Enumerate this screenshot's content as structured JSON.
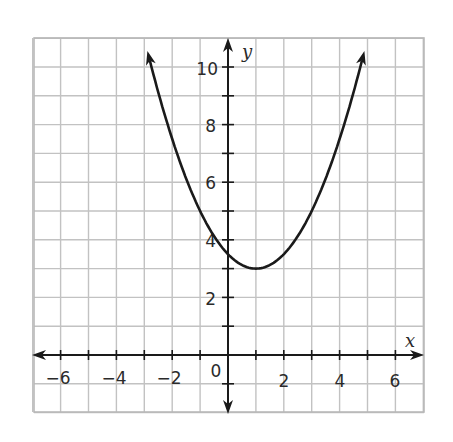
{
  "chart_data": {
    "type": "line",
    "title": "",
    "xlabel": "x",
    "ylabel": "y",
    "xlim": [
      -7,
      7
    ],
    "ylim": [
      -2,
      11
    ],
    "grid": true,
    "x_ticks": [
      -6,
      -5,
      -4,
      -3,
      -2,
      -1,
      1,
      2,
      3,
      4,
      5,
      6
    ],
    "x_tick_labels": [
      "-6",
      "-4",
      "-2",
      "0",
      "2",
      "4",
      "6"
    ],
    "y_ticks": [
      -1,
      1,
      2,
      3,
      4,
      5,
      6,
      7,
      8,
      9,
      10
    ],
    "y_tick_labels": [
      "2",
      "4",
      "6",
      "8",
      "10"
    ],
    "origin_label": "0",
    "series": [
      {
        "name": "parabola",
        "equation": "y = 0.5(x - 1)^2 + 3",
        "vertex": [
          1,
          3
        ],
        "y_intercept": 3.5,
        "x": [
          -3,
          -2,
          -1,
          0,
          1,
          2,
          3,
          4,
          5
        ],
        "values": [
          11,
          7.5,
          5,
          3.5,
          3,
          3.5,
          5,
          7.5,
          11
        ],
        "color": "#1a1a1a",
        "arrows_at_ends": true
      }
    ]
  },
  "labels": {
    "x_axis": "x",
    "y_axis": "y",
    "origin": "0",
    "x_neg6": "−6",
    "x_neg4": "−4",
    "x_neg2": "−2",
    "x_2": "2",
    "x_4": "4",
    "x_6": "6",
    "y_2": "2",
    "y_4": "4",
    "y_6": "6",
    "y_8": "8",
    "y_10": "10"
  },
  "colors": {
    "grid": "#bdbdbd",
    "axis": "#1a1a1a",
    "curve": "#1a1a1a",
    "background": "#ffffff"
  }
}
